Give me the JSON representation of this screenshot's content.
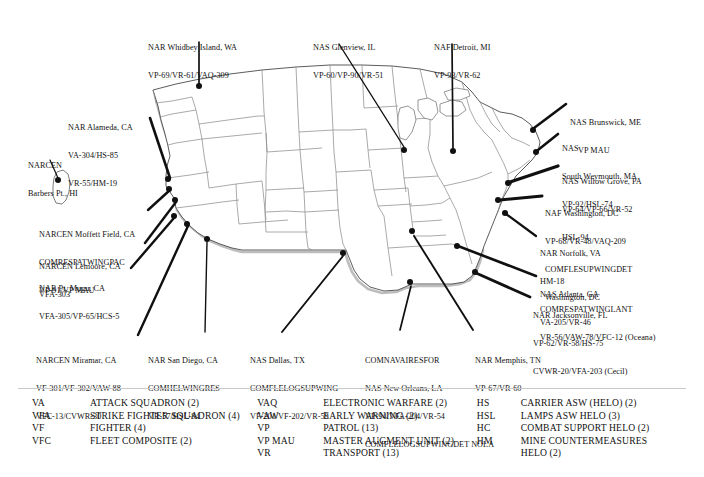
{
  "figure": {
    "kind": "map",
    "title": "",
    "background": "#ffffff",
    "ink": "#111111",
    "state_border_color": "#7a7a7a",
    "coast_shadow_color": "#b9b9b9"
  },
  "map": {
    "callouts": [
      {
        "name": "nar-whidbey-island-wa",
        "lines": [
          "NAR Whidbey Island, WA",
          "VP-69/VR-61/VAQ-309"
        ],
        "x": 148,
        "y": 24,
        "align": "left"
      },
      {
        "name": "nas-glenview-il",
        "lines": [
          "NAS Glenview, IL",
          "VP-60/VP-90/VR-51"
        ],
        "x": 313,
        "y": 24,
        "align": "left"
      },
      {
        "name": "naf-detroit-mi",
        "lines": [
          "NAF Detroit, MI",
          "VP-93/VR-62"
        ],
        "x": 434,
        "y": 24,
        "align": "left"
      },
      {
        "name": "nas-brunswick-me",
        "lines": [
          "NAS Brunswick, ME",
          "VP MAU"
        ],
        "x": 570,
        "y": 99,
        "align": "left"
      },
      {
        "name": "nas-south-weymouth-ma",
        "lines": [
          "NAS",
          "South Weymouth, MA",
          "VP-92/HSL-74"
        ],
        "x": 562,
        "y": 125,
        "align": "left"
      },
      {
        "name": "nas-willow-grove-pa",
        "lines": [
          "NAS Willow Grove, PA",
          "VP-64/VP-66/VR-52",
          "HSL-94"
        ],
        "x": 562,
        "y": 158,
        "align": "left"
      },
      {
        "name": "naf-washington-dc",
        "lines": [
          "NAF Washington, DC",
          "VP-68/VR-48/VAQ-209",
          "COMFLESUPWINGDET",
          "Washington, DC"
        ],
        "x": 545,
        "y": 190,
        "align": "left"
      },
      {
        "name": "nar-norfolk-va",
        "lines": [
          "NAR Norfolk, VA",
          "HM-18",
          "COMRESPATWINGLANT",
          "VR-56/VAW-78/VFC-12 (Oceana)"
        ],
        "x": 540,
        "y": 230,
        "align": "left"
      },
      {
        "name": "nas-atlanta-ga",
        "lines": [
          "NAS Atlanta, GA",
          "VA-205/VR-46"
        ],
        "x": 540,
        "y": 271,
        "align": "left"
      },
      {
        "name": "nar-jacksonville-fl",
        "lines": [
          "NAR Jacksonville, FL",
          "VP-62/VR-58/HS-75",
          "CVWR-20/VFA-203 (Cecil)"
        ],
        "x": 533,
        "y": 292,
        "align": "left"
      },
      {
        "name": "nar-alameda-ca",
        "lines": [
          "NAR Alameda, CA",
          "VA-304/HS-85",
          "VR-55/HM-19"
        ],
        "x": 68,
        "y": 104,
        "align": "left"
      },
      {
        "name": "narcen-barbers-pt-hi",
        "lines": [
          "NARCEN",
          "Barbers Pt., HI"
        ],
        "x": 28,
        "y": 142,
        "align": "left"
      },
      {
        "name": "narcen-moffett-field-ca",
        "lines": [
          "NARCEN Moffett Field, CA",
          "COMRESPATWINGPAC",
          "VP-91/VP MAU"
        ],
        "x": 39,
        "y": 211,
        "align": "left"
      },
      {
        "name": "narcen-lemoore-ca",
        "lines": [
          "NARCEN Lemoore, CA",
          "VFA-303"
        ],
        "x": 39,
        "y": 243,
        "align": "left"
      },
      {
        "name": "nar-pt-mugu-ca",
        "lines": [
          "NAR Pt. Mugu, CA",
          "VFA-305/VP-65/HCS-5"
        ],
        "x": 39,
        "y": 265,
        "align": "left"
      },
      {
        "name": "narcen-miramar-ca",
        "lines": [
          "NARCEN Miramar, CA",
          "VF-301/VF-302/VAW-88",
          "VFC-13/CVWR-30"
        ],
        "x": 36,
        "y": 337,
        "align": "left"
      },
      {
        "name": "nar-san-diego-ca",
        "lines": [
          "NAR San Diego, CA",
          "COMHELWINGRES",
          "VR-57/HSL-84"
        ],
        "x": 148,
        "y": 337,
        "align": "left"
      },
      {
        "name": "nas-dallas-tx",
        "lines": [
          "NAS Dallas, TX",
          "COMFLELOGSUPWING",
          "VF-201/VF-202/VR-59"
        ],
        "x": 250,
        "y": 337,
        "align": "left"
      },
      {
        "name": "comnavairesfor-nas-new-orleans-la",
        "lines": [
          "COMNAVAIRESFOR",
          "NAS New Orleans, LA",
          "VP-94/VFA-204/VR-54",
          "COMFLELOGSUPWINGDET NOLA"
        ],
        "x": 365,
        "y": 337,
        "align": "left"
      },
      {
        "name": "nar-memphis-tn",
        "lines": [
          "NAR Memphis, TN",
          "VP-67/VR-60"
        ],
        "x": 475,
        "y": 337,
        "align": "left"
      }
    ],
    "site_dots": [
      {
        "name": "dot-whidbey-island",
        "x": 199,
        "y": 86
      },
      {
        "name": "dot-barbers-pt-hi",
        "x": 58,
        "y": 180
      },
      {
        "name": "dot-alameda",
        "x": 168,
        "y": 179
      },
      {
        "name": "dot-moffett-field",
        "x": 169,
        "y": 189
      },
      {
        "name": "dot-lemoore",
        "x": 175,
        "y": 200
      },
      {
        "name": "dot-pt-mugu",
        "x": 174,
        "y": 216
      },
      {
        "name": "dot-miramar",
        "x": 187,
        "y": 224
      },
      {
        "name": "dot-san-diego",
        "x": 207,
        "y": 239
      },
      {
        "name": "dot-glenview",
        "x": 404,
        "y": 150
      },
      {
        "name": "dot-detroit",
        "x": 453,
        "y": 151
      },
      {
        "name": "dot-memphis",
        "x": 412,
        "y": 231
      },
      {
        "name": "dot-new-orleans",
        "x": 410,
        "y": 282
      },
      {
        "name": "dot-dallas",
        "x": 343,
        "y": 253
      },
      {
        "name": "dot-atlanta",
        "x": 457,
        "y": 246
      },
      {
        "name": "dot-jacksonville",
        "x": 475,
        "y": 272
      },
      {
        "name": "dot-brunswick",
        "x": 533,
        "y": 130
      },
      {
        "name": "dot-south-weymouth",
        "x": 536,
        "y": 152
      },
      {
        "name": "dot-willow-grove",
        "x": 508,
        "y": 183
      },
      {
        "name": "dot-washington-dc",
        "x": 498,
        "y": 200
      },
      {
        "name": "dot-norfolk",
        "x": 505,
        "y": 213
      }
    ]
  },
  "legend": {
    "columns": [
      {
        "name": "legend-column-fixed-wing-attack",
        "rows": [
          {
            "abbr": "VA",
            "desc": "ATTACK SQUADRON (2)"
          },
          {
            "abbr": "VFA",
            "desc": "STRIKE FIGHTER SQUADRON (4)"
          },
          {
            "abbr": "VF",
            "desc": "FIGHTER (4)"
          },
          {
            "abbr": "VFC",
            "desc": "FLEET COMPOSITE (2)"
          }
        ]
      },
      {
        "name": "legend-column-support",
        "rows": [
          {
            "abbr": "VAQ",
            "desc": "ELECTRONIC WARFARE (2)"
          },
          {
            "abbr": "VAW",
            "desc": "EARLY WARNING (2)"
          },
          {
            "abbr": "VP",
            "desc": "PATROL (13)"
          },
          {
            "abbr": "VP MAU",
            "desc": "MASTER AUGMENT UNIT (2)"
          },
          {
            "abbr": "VR",
            "desc": "TRANSPORT (13)"
          }
        ]
      },
      {
        "name": "legend-column-helo",
        "rows": [
          {
            "abbr": "HS",
            "desc": "CARRIER ASW (HELO) (2)"
          },
          {
            "abbr": "HSL",
            "desc": "LAMPS ASW HELO (3)"
          },
          {
            "abbr": "HC",
            "desc": "COMBAT SUPPORT HELO (2)"
          },
          {
            "abbr": "HM",
            "desc": "MINE COUNTERMEASURES\nHELO (2)"
          }
        ]
      }
    ]
  }
}
